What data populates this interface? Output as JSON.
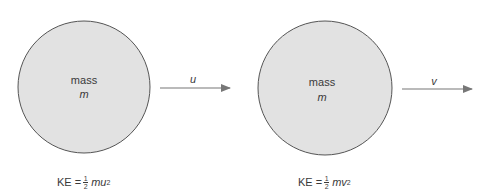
{
  "diagram": {
    "colors": {
      "ball_fill": "#e2e2e2",
      "ball_stroke": "#555555",
      "arrow": "#777777",
      "text": "#3a3a3a"
    },
    "before": {
      "mass_label": "mass",
      "mass_symbol": "m",
      "velocity_symbol": "u",
      "ke": {
        "prefix": "KE =",
        "num": "1",
        "den": "2",
        "term": "mu",
        "exp": "2"
      }
    },
    "after": {
      "mass_label": "mass",
      "mass_symbol": "m",
      "velocity_symbol": "v",
      "ke": {
        "prefix": "KE =",
        "num": "1",
        "den": "2",
        "term": "mv",
        "exp": "2"
      }
    }
  }
}
